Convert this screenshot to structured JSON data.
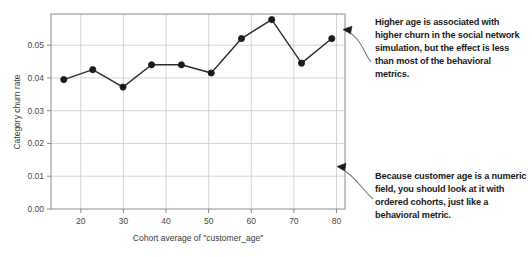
{
  "chart_data": {
    "type": "line",
    "title": "",
    "xlabel": "Cohort average of \"customer_age\"",
    "ylabel": "Category churn rate",
    "xlim": [
      13,
      82
    ],
    "ylim": [
      0.0,
      0.0595
    ],
    "grid": true,
    "legend": "none",
    "marker": "filled-circle",
    "line_color": "#2b2b2b",
    "marker_color": "#1a1a1a",
    "grid_color": "#cfcfcf",
    "axis_color": "#8a8a8a",
    "x": [
      16.0,
      22.8,
      29.9,
      36.6,
      43.6,
      50.6,
      57.7,
      64.8,
      71.8,
      78.9
    ],
    "values": [
      0.0395,
      0.0425,
      0.0372,
      0.044,
      0.044,
      0.0415,
      0.052,
      0.0578,
      0.0445,
      0.052
    ],
    "xticks": [
      20,
      30,
      40,
      50,
      60,
      70,
      80
    ],
    "xticklabels": [
      "20",
      "30",
      "40",
      "50",
      "60",
      "70",
      "80"
    ],
    "yticks": [
      0.0,
      0.01,
      0.02,
      0.03,
      0.04,
      0.05
    ],
    "yticklabels": [
      "0.00",
      "0.01",
      "0.02",
      "0.03",
      "0.04",
      "0.05"
    ]
  },
  "annotations": [
    {
      "id": "callout-higher-age",
      "text": "Higher age is associated with higher churn in the social network simulation, but the effect is less than most of the behavioral metrics.",
      "arrow_target": "top-right of plot"
    },
    {
      "id": "callout-numeric-field",
      "text": "Because customer age is a numeric field, you should look at it with ordered cohorts, just like a behavioral metric.",
      "arrow_target": "lower-right of plot"
    }
  ]
}
